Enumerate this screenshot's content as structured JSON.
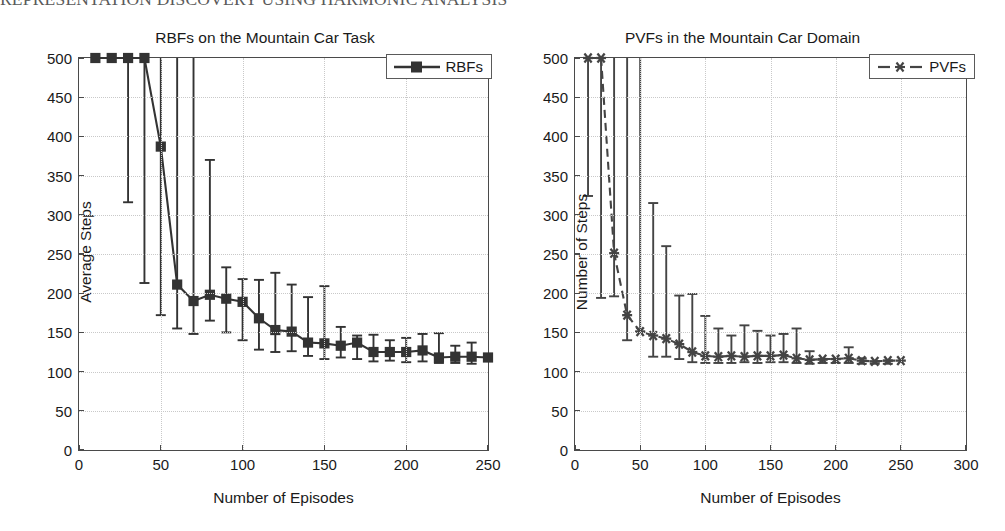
{
  "page": {
    "running_header": "REPRESENTATION DISCOVERY USING HARMONIC ANALYSIS"
  },
  "figures": [
    {
      "id": "left",
      "title": "RBFs on the Mountain Car Task",
      "legend_label": "RBFs",
      "xlabel": "Number of Episodes",
      "ylabel": "Average Steps",
      "xticks": [
        "0",
        "50",
        "100",
        "150",
        "200",
        "250"
      ],
      "yticks": [
        "0",
        "50",
        "100",
        "150",
        "200",
        "250",
        "300",
        "350",
        "400",
        "450",
        "500"
      ]
    },
    {
      "id": "right",
      "title": "PVFs in the Mountain Car Domain",
      "legend_label": "PVFs",
      "xlabel": "Number of Episodes",
      "ylabel": "Number of Steps",
      "xticks": [
        "0",
        "50",
        "100",
        "150",
        "200",
        "250",
        "300"
      ],
      "yticks": [
        "0",
        "50",
        "100",
        "150",
        "200",
        "250",
        "300",
        "350",
        "400",
        "450",
        "500"
      ]
    }
  ],
  "chart_data": [
    {
      "type": "line",
      "id": "rbfs-mountain-car",
      "title": "RBFs on the Mountain Car Task",
      "xlabel": "Number of Episodes",
      "ylabel": "Average Steps",
      "xlim": [
        0,
        250
      ],
      "ylim": [
        0,
        500
      ],
      "xtick_step": 50,
      "ytick_step": 50,
      "grid": true,
      "legend_position": "top-right",
      "series": [
        {
          "name": "RBFs",
          "line_style": "solid",
          "marker": "filled-square",
          "color": "#333333",
          "x": [
            10,
            20,
            30,
            40,
            50,
            60,
            70,
            80,
            90,
            100,
            110,
            120,
            130,
            140,
            150,
            160,
            170,
            180,
            190,
            200,
            210,
            220,
            230,
            240,
            250
          ],
          "y": [
            500,
            500,
            500,
            500,
            387,
            211,
            190,
            198,
            193,
            189,
            168,
            153,
            151,
            137,
            136,
            133,
            137,
            125,
            125,
            125,
            127,
            118,
            119,
            119,
            118
          ],
          "err_upper": [
            500,
            500,
            500,
            500,
            500,
            500,
            500,
            370,
            233,
            218,
            217,
            226,
            211,
            195,
            209,
            157,
            146,
            147,
            140,
            143,
            148,
            149,
            133,
            137,
            118
          ],
          "err_lower": [
            500,
            500,
            316,
            213,
            172,
            155,
            148,
            165,
            150,
            140,
            128,
            125,
            126,
            120,
            116,
            118,
            116,
            113,
            114,
            112,
            113,
            111,
            111,
            110,
            118
          ]
        }
      ]
    },
    {
      "type": "line",
      "id": "pvfs-mountain-car",
      "title": "PVFs in the Mountain Car Domain",
      "xlabel": "Number of Episodes",
      "ylabel": "Number of Steps",
      "xlim": [
        0,
        300
      ],
      "ylim": [
        0,
        500
      ],
      "xtick_step": 50,
      "ytick_step": 50,
      "grid": true,
      "legend_position": "top-right",
      "series": [
        {
          "name": "PVFs",
          "line_style": "dashed",
          "marker": "asterisk",
          "color": "#444444",
          "x": [
            10,
            20,
            30,
            40,
            50,
            60,
            70,
            80,
            90,
            100,
            110,
            120,
            130,
            140,
            150,
            160,
            170,
            180,
            190,
            200,
            210,
            220,
            230,
            240,
            250
          ],
          "y": [
            500,
            500,
            251,
            172,
            151,
            146,
            142,
            135,
            125,
            120,
            119,
            120,
            119,
            120,
            120,
            121,
            117,
            115,
            116,
            116,
            117,
            114,
            113,
            114,
            114
          ],
          "err_upper": [
            500,
            500,
            500,
            500,
            500,
            315,
            260,
            197,
            199,
            171,
            155,
            146,
            159,
            152,
            146,
            148,
            155,
            126,
            115,
            116,
            131,
            117,
            113,
            114,
            114
          ],
          "err_lower": [
            324,
            194,
            196,
            140,
            151,
            119,
            119,
            116,
            112,
            111,
            111,
            111,
            112,
            111,
            112,
            112,
            111,
            110,
            111,
            111,
            111,
            110,
            110,
            110,
            114
          ]
        }
      ]
    }
  ]
}
